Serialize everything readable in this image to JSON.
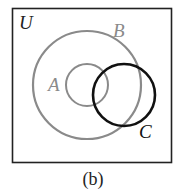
{
  "diagram": {
    "type": "venn",
    "universe_label": "U",
    "sets": [
      {
        "name": "A",
        "label": "A",
        "color": "#8a8a8a",
        "relation": "subset of B"
      },
      {
        "name": "B",
        "label": "B",
        "color": "#8a8a8a"
      },
      {
        "name": "C",
        "label": "C",
        "color": "#111111",
        "relation": "overlaps A and B"
      }
    ],
    "caption": "(b)"
  },
  "colors": {
    "frame": "#222222",
    "gray_circles": "#8a8a8a",
    "dark_circle": "#111111"
  }
}
